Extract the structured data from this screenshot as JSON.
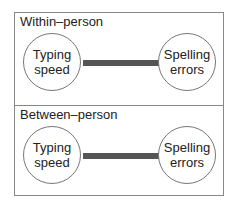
{
  "panels": [
    {
      "title": "Within–person",
      "nodes": [
        {
          "line1": "Typing",
          "line2": "speed"
        },
        {
          "line1": "Spelling",
          "line2": "errors"
        }
      ]
    },
    {
      "title": "Between–person",
      "nodes": [
        {
          "line1": "Typing",
          "line2": "speed"
        },
        {
          "line1": "Spelling",
          "line2": "errors"
        }
      ]
    }
  ],
  "colors": {
    "edge": "#555555",
    "border": "#888888"
  }
}
